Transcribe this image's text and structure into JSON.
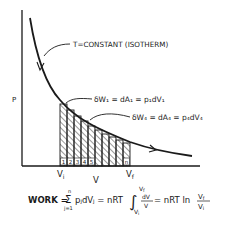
{
  "diagram": {
    "type": "pv-isotherm",
    "curve_label": "T=CONSTANT (ISOTHERM)",
    "y_axis_label": "P",
    "x_axis_label": "V",
    "x_tick_left": "V",
    "x_tick_left_sub": "i",
    "x_tick_right": "V",
    "x_tick_right_sub": "f",
    "annotation_1": "δW₁ = dA₁ = p₁dV₁",
    "annotation_4": "δW₄ = dA₄ = p₄dV₄",
    "strip_numbers": [
      "1",
      "2",
      "3",
      "4",
      "5"
    ],
    "strip_last": "n",
    "formula": {
      "lhs": "WORK =",
      "sum_top": "n",
      "sum_bottom": "j=1",
      "sum_body": "pⱼdVⱼ = nRT",
      "int_top": "V",
      "int_top_sub": "f",
      "int_bottom": "V",
      "int_bottom_sub": "i",
      "int_num": "dV",
      "int_den": "V",
      "rhs": "= nRT ln",
      "frac_num": "V",
      "frac_num_sub": "f",
      "frac_den": "V",
      "frac_den_sub": "i"
    },
    "colors": {
      "ink": "#1a1a1a",
      "background": "#ffffff"
    }
  }
}
